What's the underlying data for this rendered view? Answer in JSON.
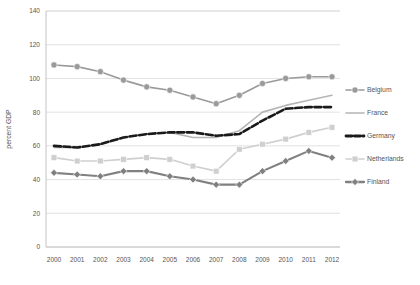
{
  "chart_data": {
    "type": "line",
    "title": "",
    "xlabel": "",
    "ylabel": "percent GDP",
    "ylim": [
      0,
      140
    ],
    "yticks": [
      0,
      20,
      40,
      60,
      80,
      100,
      120,
      140
    ],
    "grid": true,
    "legend_position": "right",
    "categories": [
      "2000",
      "2001",
      "2002",
      "2003",
      "2004",
      "2005",
      "2006",
      "2007",
      "2008",
      "2009",
      "2010",
      "2011",
      "2012"
    ],
    "series": [
      {
        "name": "Belgium",
        "color": "#9a9a9a",
        "marker": "circle",
        "dash": "none",
        "values": [
          108,
          107,
          104,
          99,
          95,
          93,
          89,
          85,
          90,
          97,
          100,
          101,
          101
        ]
      },
      {
        "name": "France",
        "color": "#b5b5b5",
        "marker": "none",
        "dash": "none",
        "values": [
          59,
          59,
          61,
          65,
          67,
          68,
          65,
          65,
          69,
          80,
          84,
          87,
          90
        ]
      },
      {
        "name": "Germany",
        "color": "#1a1a1a",
        "marker": "none",
        "dash": "dashed",
        "values": [
          60,
          59,
          61,
          65,
          67,
          68,
          68,
          66,
          67,
          75,
          82,
          83,
          83
        ]
      },
      {
        "name": "Netherlands",
        "color": "#cfcfcf",
        "marker": "square",
        "dash": "none",
        "values": [
          53,
          51,
          51,
          52,
          53,
          52,
          48,
          45,
          58,
          61,
          64,
          68,
          71
        ]
      },
      {
        "name": "Finland",
        "color": "#808080",
        "marker": "diamond",
        "dash": "none",
        "values": [
          44,
          43,
          42,
          45,
          45,
          42,
          40,
          37,
          37,
          45,
          51,
          57,
          53
        ]
      }
    ]
  },
  "legend": {
    "items": [
      {
        "label": "Belgium"
      },
      {
        "label": "France"
      },
      {
        "label": "Germany"
      },
      {
        "label": "Netherlands"
      },
      {
        "label": "Finland"
      }
    ]
  }
}
